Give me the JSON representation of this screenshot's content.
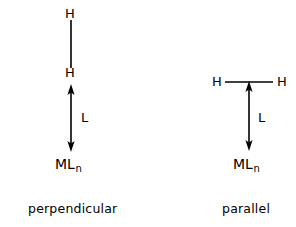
{
  "figure": {
    "background_color": "#ffffff",
    "stroke_color": "#000000",
    "width": 296,
    "height": 227
  },
  "diagrams": [
    {
      "id": "perpendicular",
      "caption": "perpendicular",
      "geometry": "H-H bond oriented vertically, collinear with the L arrow to the metal center",
      "labels": {
        "h_top": "H",
        "h_bottom": "H",
        "ligand": "L",
        "metal": "ML",
        "metal_subscript": "n"
      }
    },
    {
      "id": "parallel",
      "caption": "parallel",
      "geometry": "H-H bond oriented horizontally, perpendicular to the L arrow to the metal center",
      "labels": {
        "h_left": "H",
        "h_right": "H",
        "ligand": "L",
        "metal": "ML",
        "metal_subscript": "n"
      }
    }
  ]
}
